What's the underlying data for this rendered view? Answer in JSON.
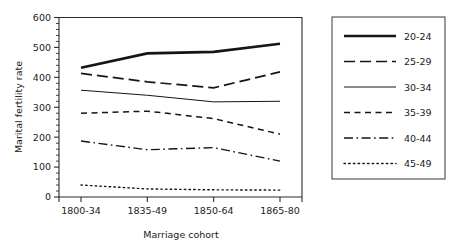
{
  "chart_data": {
    "type": "line",
    "title": "",
    "subtitle": "",
    "xlabel": "Marriage cohort",
    "ylabel": "Marital fertility rate",
    "categories": [
      "1800-34",
      "1835-49",
      "1850-64",
      "1865-80"
    ],
    "ylim": [
      0,
      600
    ],
    "yticks": [
      0,
      100,
      200,
      300,
      400,
      500,
      600
    ],
    "ytick_labels": [
      "0",
      "100",
      "200",
      "300",
      "400",
      "500",
      "600"
    ],
    "minor_tick_step": 20,
    "grid": false,
    "legend_position": "right",
    "series": [
      {
        "name": "20-24",
        "style": "solid-thick",
        "color": "#151515",
        "values": [
          432,
          480,
          485,
          512
        ]
      },
      {
        "name": "25-29",
        "style": "long-dash",
        "color": "#151515",
        "values": [
          413,
          385,
          365,
          418
        ]
      },
      {
        "name": "30-34",
        "style": "solid-thin",
        "color": "#151515",
        "values": [
          357,
          340,
          318,
          320
        ]
      },
      {
        "name": "35-39",
        "style": "short-dash",
        "color": "#151515",
        "values": [
          280,
          287,
          262,
          210
        ]
      },
      {
        "name": "40-44",
        "style": "dash-dot",
        "color": "#151515",
        "values": [
          187,
          158,
          165,
          120
        ]
      },
      {
        "name": "45-49",
        "style": "dotted",
        "color": "#151515",
        "values": [
          40,
          27,
          24,
          23
        ]
      }
    ]
  },
  "legend": {
    "entries": [
      {
        "label": "20-24"
      },
      {
        "label": "25-29"
      },
      {
        "label": "30-34"
      },
      {
        "label": "35-39"
      },
      {
        "label": "40-44"
      },
      {
        "label": "45-49"
      }
    ]
  }
}
